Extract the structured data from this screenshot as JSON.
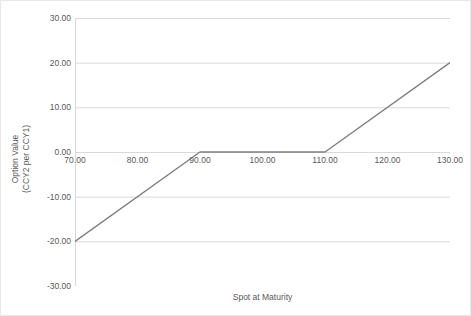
{
  "chart_data": {
    "type": "line",
    "title": "",
    "xlabel": "Spot at Maturity",
    "ylabel": "Option Value\n(CCY2 per CCY1)",
    "ylabel_lines": [
      "Option Value",
      "(CCY2 per CCY1)"
    ],
    "xlim": [
      70,
      130
    ],
    "ylim": [
      -30,
      30
    ],
    "xticks": [
      70,
      100,
      130
    ],
    "xtick_labels": [
      "70.00",
      "80.00",
      "90.00",
      "100.00",
      "110.00",
      "120.00",
      "130.00"
    ],
    "xtick_values": [
      70,
      80,
      90,
      100,
      110,
      120,
      130
    ],
    "ytick_labels": [
      "30.00",
      "20.00",
      "10.00",
      "0.00",
      "-10.00",
      "-20.00",
      "-30.00"
    ],
    "ytick_values": [
      30,
      20,
      10,
      0,
      -10,
      -20,
      -30
    ],
    "grid": "horizontal",
    "legend": "none",
    "series": [
      {
        "name": "Option Value",
        "color": "#7f7f7f",
        "x": [
          70,
          90,
          110,
          130
        ],
        "values": [
          -20,
          0,
          0,
          20
        ]
      }
    ]
  },
  "axes": {
    "y_title_line1": "Option Value",
    "y_title_line2": "(CCY2 per CCY1)",
    "x_title": "Spot at Maturity",
    "y_ticks": [
      {
        "label": "30.00",
        "value": 30
      },
      {
        "label": "20.00",
        "value": 20
      },
      {
        "label": "10.00",
        "value": 10
      },
      {
        "label": "0.00",
        "value": 0
      },
      {
        "label": "-10.00",
        "value": -10
      },
      {
        "label": "-20.00",
        "value": -20
      },
      {
        "label": "-30.00",
        "value": -30
      }
    ],
    "x_ticks": [
      {
        "label": "70.00",
        "value": 70
      },
      {
        "label": "80.00",
        "value": 80
      },
      {
        "label": "90.00",
        "value": 90
      },
      {
        "label": "100.00",
        "value": 100
      },
      {
        "label": "110.00",
        "value": 110
      },
      {
        "label": "120.00",
        "value": 120
      },
      {
        "label": "130.00",
        "value": 130
      }
    ]
  },
  "style": {
    "series_color": "#7f7f7f",
    "gridline_color": "#d9d9d9",
    "axis_color": "#d9d9d9",
    "text_color": "#595959",
    "background": "#ffffff",
    "border_color": "#e8e8e8"
  }
}
